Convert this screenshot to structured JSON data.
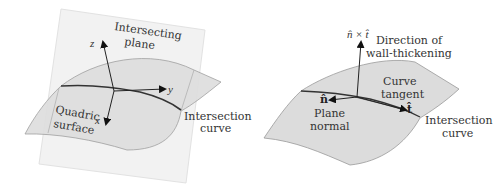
{
  "left_figure": {
    "plane_label_line1": "Intersecting",
    "plane_label_line2": "plane",
    "surface_label_line1": "Quadric",
    "surface_label_line2": "surface",
    "curve_label_line1": "Intersection",
    "curve_label_line2": "curve",
    "axes": {
      "x": "x",
      "y": "y",
      "z": "z"
    }
  },
  "right_figure": {
    "cross_product_label": "n̂ × t̂",
    "direction_label_line1": "Direction of",
    "direction_label_line2": "wall-thickening",
    "tangent_label_line1": "Curve",
    "tangent_label_line2": "tangent",
    "tangent_vector": "t̂",
    "normal_vector": "n̂",
    "normal_label_line1": "Plane",
    "normal_label_line2": "normal",
    "curve_label_line1": "Intersection",
    "curve_label_line2": "curve"
  },
  "colors": {
    "surface_fill": "#dcdcdc",
    "plane_fill": "#f1f1f1",
    "edge": "#888888",
    "curve": "#333333",
    "text": "#333333"
  }
}
